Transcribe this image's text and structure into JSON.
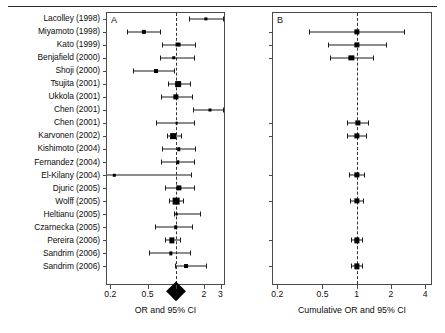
{
  "figure": {
    "width": 445,
    "height": 333,
    "background": "#ffffff",
    "ink_color": "#000000"
  },
  "studies": [
    "Lacolley (1998)",
    "Miyamoto (1998)",
    "Kato (1999)",
    "Benjafield (2000)",
    "Shoji (2000)",
    "Tsujita (2001)",
    "Ukkola (2001)",
    "Chen (2001)",
    "Chen (2001)",
    "Karvonen (2002)",
    "Kishimoto (2004)",
    "Fernandez (2004)",
    "El-Kilany (2004)",
    "Djuric (2005)",
    "Wolff (2005)",
    "Heltianu (2005)",
    "Czarnecka (2005)",
    "Pereira (2006)",
    "Sandrim (2006)",
    "Sandrim (2006)"
  ],
  "chart_data": [
    {
      "type": "forest",
      "panel": "A",
      "title": "A",
      "xlabel": "OR and 95% CI",
      "xscale": "log",
      "xlim": [
        0.18,
        3.35
      ],
      "ticks": [
        0.2,
        0.5,
        1,
        2,
        3
      ],
      "tick_labels": [
        "0.2",
        "0.5",
        "1",
        "2",
        "3"
      ],
      "null_value": 1,
      "grid": false,
      "categories": [
        "Lacolley (1998)",
        "Miyamoto (1998)",
        "Kato (1999)",
        "Benjafield (2000)",
        "Shoji (2000)",
        "Tsujita (2001)",
        "Ukkola (2001)",
        "Chen (2001)",
        "Chen (2001)",
        "Karvonen (2002)",
        "Kishimoto (2004)",
        "Fernandez (2004)",
        "El-Kilany (2004)",
        "Djuric (2005)",
        "Wolff (2005)",
        "Heltianu (2005)",
        "Czarnecka (2005)",
        "Pereira (2006)",
        "Sandrim (2006)",
        "Sandrim (2006)"
      ],
      "points": [
        {
          "study": "Lacolley (1998)",
          "or": 2.1,
          "lcl": 1.4,
          "ucl": 3.2,
          "weight": 2.6
        },
        {
          "study": "Miyamoto (1998)",
          "or": 0.46,
          "lcl": 0.3,
          "ucl": 0.68,
          "weight": 3.4
        },
        {
          "study": "Kato (1999)",
          "or": 1.05,
          "lcl": 0.72,
          "ucl": 1.62,
          "weight": 3.9
        },
        {
          "study": "Benjafield (2000)",
          "or": 0.95,
          "lcl": 0.68,
          "ucl": 1.55,
          "weight": 2.8
        },
        {
          "study": "Shoji (2000)",
          "or": 0.62,
          "lcl": 0.35,
          "ucl": 0.95,
          "weight": 3.1
        },
        {
          "study": "Tsujita (2001)",
          "or": 1.06,
          "lcl": 0.82,
          "ucl": 1.42,
          "weight": 4.6
        },
        {
          "study": "Ukkola (2001)",
          "or": 1.0,
          "lcl": 0.7,
          "ucl": 1.48,
          "weight": 4.2
        },
        {
          "study": "Chen (2001)",
          "or": 2.3,
          "lcl": 1.52,
          "ucl": 3.2,
          "weight": 2.4
        },
        {
          "study": "Chen (2001)",
          "or": 1.02,
          "lcl": 0.62,
          "ucl": 1.55,
          "weight": 2.2
        },
        {
          "study": "Karvonen (2002)",
          "or": 0.94,
          "lcl": 0.8,
          "ucl": 1.14,
          "weight": 4.6
        },
        {
          "study": "Kishimoto (2004)",
          "or": 1.08,
          "lcl": 0.72,
          "ucl": 1.62,
          "weight": 2.8
        },
        {
          "study": "Fernandez (2004)",
          "or": 1.05,
          "lcl": 0.7,
          "ucl": 1.55,
          "weight": 2.8
        },
        {
          "study": "El-Kilany (2004)",
          "or": 0.22,
          "lcl": 0.18,
          "ucl": 1.45,
          "weight": 1.6
        },
        {
          "study": "Djuric (2005)",
          "or": 1.08,
          "lcl": 0.76,
          "ucl": 1.55,
          "weight": 4.2
        },
        {
          "study": "Wolff (2005)",
          "or": 1.0,
          "lcl": 0.85,
          "ucl": 1.2,
          "weight": 5.4
        },
        {
          "study": "Heltianu (2005)",
          "or": 1.02,
          "lcl": 0.96,
          "ucl": 1.82,
          "weight": 2.2
        },
        {
          "study": "Czarnecka (2005)",
          "or": 1.0,
          "lcl": 0.6,
          "ucl": 1.48,
          "weight": 2.8
        },
        {
          "study": "Pereira (2006)",
          "or": 0.9,
          "lcl": 0.76,
          "ucl": 1.12,
          "weight": 4.2
        },
        {
          "study": "Sandrim (2006)",
          "or": 0.88,
          "lcl": 0.52,
          "ucl": 1.42,
          "weight": 2.6
        },
        {
          "study": "Sandrim (2006)",
          "or": 1.28,
          "lcl": 0.98,
          "ucl": 2.1,
          "weight": 3.1
        }
      ],
      "summary": {
        "label": "Overall",
        "or": 1.0,
        "lcl": 0.9,
        "ucl": 1.12,
        "shape": "diamond"
      }
    },
    {
      "type": "forest",
      "panel": "B",
      "title": "B",
      "xlabel": "Cumulative OR and 95% CI",
      "xscale": "log",
      "xlim": [
        0.18,
        4.6
      ],
      "ticks": [
        0.2,
        0.5,
        1,
        2,
        4
      ],
      "tick_labels": [
        "0.2",
        "0.5",
        "1",
        "2",
        "4"
      ],
      "null_value": 1,
      "grid": false,
      "points": [
        {
          "row": 1,
          "or": 1.0,
          "lcl": 0.38,
          "ucl": 2.6,
          "weight": 4.2
        },
        {
          "row": 2,
          "or": 1.0,
          "lcl": 0.56,
          "ucl": 1.8,
          "weight": 4.2
        },
        {
          "row": 3,
          "or": 0.9,
          "lcl": 0.58,
          "ucl": 1.38,
          "weight": 4.2
        },
        {
          "row": 8,
          "or": 1.02,
          "lcl": 0.82,
          "ucl": 1.26,
          "weight": 4.2
        },
        {
          "row": 9,
          "or": 1.0,
          "lcl": 0.82,
          "ucl": 1.22,
          "weight": 4.2
        },
        {
          "row": 12,
          "or": 1.0,
          "lcl": 0.86,
          "ucl": 1.16,
          "weight": 4.2
        },
        {
          "row": 14,
          "or": 1.0,
          "lcl": 0.88,
          "ucl": 1.14,
          "weight": 4.2
        },
        {
          "row": 17,
          "or": 1.0,
          "lcl": 0.9,
          "ucl": 1.12,
          "weight": 4.2
        },
        {
          "row": 19,
          "or": 1.0,
          "lcl": 0.9,
          "ucl": 1.11,
          "weight": 4.2
        }
      ]
    }
  ]
}
